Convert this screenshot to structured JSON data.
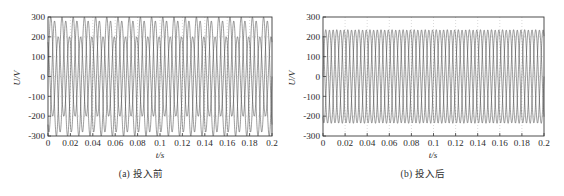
{
  "figure": {
    "panels": [
      {
        "id": "panel-a",
        "caption": "(a) 投入前",
        "xlabel": "t/s",
        "ylabel": "U/V",
        "xticks": [
          "0",
          "0.02",
          "0.04",
          "0.06",
          "0.08",
          "0.1",
          "0.12",
          "0.14",
          "0.16",
          "0.18",
          "0.2"
        ],
        "yticks": [
          "300",
          "200",
          "100",
          "0",
          "-100",
          "-200",
          "-300"
        ]
      },
      {
        "id": "panel-b",
        "caption": "(b) 投入后",
        "xlabel": "t/s",
        "ylabel": "U/V",
        "xticks": [
          "0",
          "0.02",
          "0.04",
          "0.06",
          "0.08",
          "0.1",
          "0.12",
          "0.14",
          "0.16",
          "0.18",
          "0.2"
        ],
        "yticks": [
          "300",
          "200",
          "100",
          "0",
          "-100",
          "-200",
          "-300"
        ]
      }
    ]
  },
  "chart_data": [
    {
      "type": "line",
      "title": "(a) 投入前",
      "xlabel": "t/s",
      "ylabel": "U/V",
      "xlim": [
        0,
        0.2
      ],
      "ylim": [
        -300,
        300
      ],
      "xticks": [
        0,
        0.02,
        0.04,
        0.06,
        0.08,
        0.1,
        0.12,
        0.14,
        0.16,
        0.18,
        0.2
      ],
      "yticks": [
        -300,
        -200,
        -100,
        0,
        100,
        200,
        300
      ],
      "grid": true,
      "legend": "none",
      "description": "Three-phase unbalanced voltage waveforms before compensation device is switched in; phase amplitudes differ markedly.",
      "series": [
        {
          "name": "phase-a",
          "waveform": "sine",
          "amplitude": 300,
          "frequency_hz": 100,
          "phase_deg": 0,
          "color": "#4a4a4a"
        },
        {
          "name": "phase-b",
          "waveform": "sine",
          "amplitude": 280,
          "frequency_hz": 100,
          "phase_deg": -120,
          "color": "#4a4a4a"
        },
        {
          "name": "phase-c",
          "waveform": "sine",
          "amplitude": 200,
          "frequency_hz": 100,
          "phase_deg": 120,
          "color": "#4a4a4a"
        }
      ]
    },
    {
      "type": "line",
      "title": "(b) 投入后",
      "xlabel": "t/s",
      "ylabel": "U/V",
      "xlim": [
        0,
        0.2
      ],
      "ylim": [
        -300,
        300
      ],
      "xticks": [
        0,
        0.02,
        0.04,
        0.06,
        0.08,
        0.1,
        0.12,
        0.14,
        0.16,
        0.18,
        0.2
      ],
      "yticks": [
        -300,
        -200,
        -100,
        0,
        100,
        200,
        300
      ],
      "grid": true,
      "legend": "none",
      "description": "Three-phase voltage waveforms after compensation device is switched in; all three phases balanced at about 235 V peak.",
      "series": [
        {
          "name": "phase-a",
          "waveform": "sine",
          "amplitude": 236,
          "frequency_hz": 100,
          "phase_deg": 0,
          "color": "#4a4a4a"
        },
        {
          "name": "phase-b",
          "waveform": "sine",
          "amplitude": 234,
          "frequency_hz": 100,
          "phase_deg": -120,
          "color": "#4a4a4a"
        },
        {
          "name": "phase-c",
          "waveform": "sine",
          "amplitude": 235,
          "frequency_hz": 100,
          "phase_deg": 120,
          "color": "#4a4a4a"
        }
      ]
    }
  ]
}
